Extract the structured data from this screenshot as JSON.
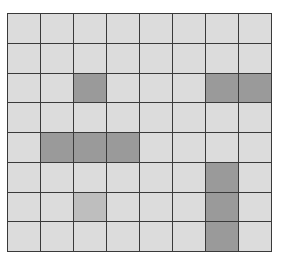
{
  "board": {
    "rows": 8,
    "cols": 8,
    "colors": {
      "empty": "#dcdcdc",
      "filled": "#9a9a9a",
      "highlight": "#bebebe",
      "grid": "#3a3a3a"
    },
    "cells": [
      [
        0,
        0,
        0,
        0,
        0,
        0,
        0,
        0
      ],
      [
        0,
        0,
        0,
        0,
        0,
        0,
        0,
        0
      ],
      [
        0,
        0,
        1,
        0,
        0,
        0,
        1,
        1
      ],
      [
        0,
        0,
        0,
        0,
        0,
        0,
        0,
        0
      ],
      [
        0,
        1,
        1,
        1,
        0,
        0,
        0,
        0
      ],
      [
        0,
        0,
        0,
        0,
        0,
        0,
        1,
        0
      ],
      [
        0,
        0,
        2,
        0,
        0,
        0,
        1,
        0
      ],
      [
        0,
        0,
        0,
        0,
        0,
        0,
        1,
        0
      ]
    ]
  }
}
